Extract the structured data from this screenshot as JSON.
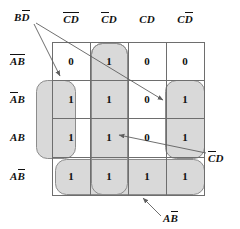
{
  "diagram": {
    "type": "karnaugh-map",
    "variables": [
      "A",
      "B",
      "C",
      "D"
    ],
    "grid": {
      "rows": 4,
      "cols": 4,
      "origin_x": 52,
      "origin_y": 42,
      "cell_w": 38,
      "cell_h": 38
    },
    "column_headers": [
      {
        "id": "col-0",
        "text": "CD",
        "bars": "both",
        "display": "C̄D̄"
      },
      {
        "id": "col-1",
        "text": "CD",
        "bars": "first",
        "display": "C̄D"
      },
      {
        "id": "col-2",
        "text": "CD",
        "bars": "none",
        "display": "CD"
      },
      {
        "id": "col-3",
        "text": "CD",
        "bars": "second",
        "display": "CD̄"
      }
    ],
    "row_headers": [
      {
        "id": "row-0",
        "text": "AB",
        "bars": "both",
        "display": "ĀB̄"
      },
      {
        "id": "row-1",
        "text": "AB",
        "bars": "first",
        "display": "ĀB"
      },
      {
        "id": "row-2",
        "text": "AB",
        "bars": "none",
        "display": "AB"
      },
      {
        "id": "row-3",
        "text": "AB",
        "bars": "second",
        "display": "AB̄"
      }
    ],
    "cells": [
      [
        "0",
        "1",
        "0",
        "0"
      ],
      [
        "1",
        "1",
        "0",
        "1"
      ],
      [
        "1",
        "1",
        "0",
        "1"
      ],
      [
        "1",
        "1",
        "1",
        "1"
      ]
    ],
    "groups": [
      {
        "id": "group-bd-not",
        "label_text": "BD",
        "label_bars": "second",
        "label_display": "BD̄",
        "covers": "column 0 and column 3, rows 1-2 (wrap-around)"
      },
      {
        "id": "group-c-not-d",
        "label_text": "CD",
        "label_bars": "first",
        "label_display": "C̄D",
        "covers": "column 1, rows 0-3"
      },
      {
        "id": "group-ab-not",
        "label_text": "AB",
        "label_bars": "second",
        "label_display": "AB̄",
        "covers": "row 3, all columns"
      }
    ],
    "annotations": [
      {
        "id": "anno-bd-not",
        "text": "BD",
        "bars": "second",
        "display": "B D̄",
        "position": "top-left",
        "arrows": 2
      },
      {
        "id": "anno-c-not-d",
        "text": "CD",
        "bars": "first",
        "display": "C̄D",
        "position": "right",
        "arrows": 1
      },
      {
        "id": "anno-ab-not",
        "text": "AB",
        "bars": "second",
        "display": "AB̄",
        "position": "bottom",
        "arrows": 1
      }
    ],
    "colors": {
      "group_fill": "#d9d9d9",
      "group_stroke": "#8c8c8c",
      "grid_stroke": "#6e6e6e",
      "text": "#111111",
      "arrow": "#6e6e6e",
      "background": "#ffffff"
    }
  }
}
